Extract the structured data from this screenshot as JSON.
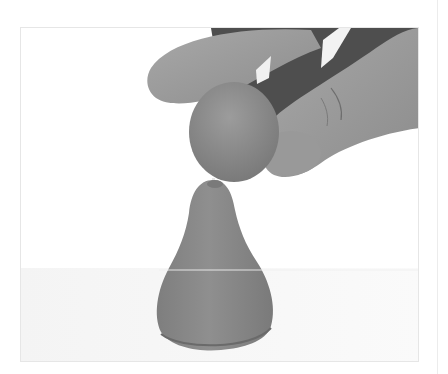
{
  "figure": {
    "alt": "Hand holding a clay ball on a toothpick above a clay pear shape",
    "caption": "",
    "colors": {
      "background": "#ffffff",
      "frame_border": "#e6e6e6",
      "clay": "#8a8a8a",
      "clay_shadow": "#6e6e6e",
      "skin": "#9a9a9a",
      "skin_dark": "#5a5a5a",
      "toothpick": "#e8e8e8"
    }
  }
}
